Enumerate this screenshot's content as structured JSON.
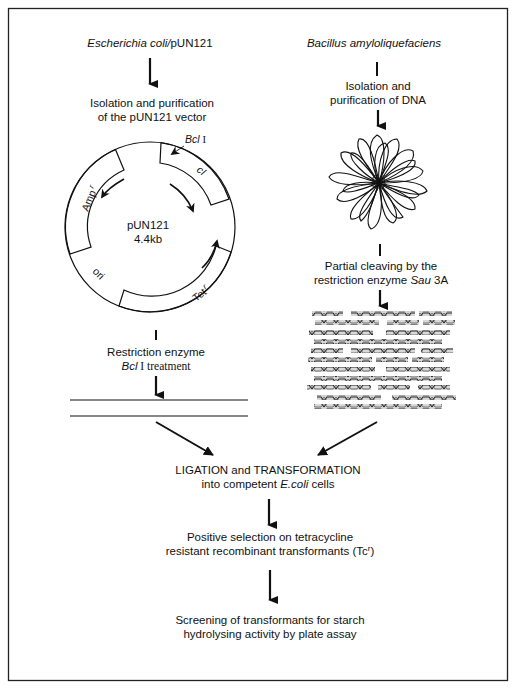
{
  "figure": {
    "type": "cloning-workflow-flowchart",
    "left_branch": {
      "source": "Escherichia coli/pUN121",
      "source_italic": "Escherichia coli/",
      "source_plain": "pUN121",
      "step1": [
        "Isolation and purification",
        "of the pUN121 vector"
      ],
      "plasmid": {
        "name": "pUN121",
        "size": "4.4kb",
        "labels": {
          "site": "Bcl",
          "site_numeral": "I",
          "gene_ci": "cI",
          "gene_amp": "Amp",
          "gene_amp_sup": "r",
          "gene_tet": "Tet",
          "gene_tet_sup": "r",
          "ori": "ori"
        }
      },
      "step2": {
        "line1": "Restriction enzyme",
        "line2_italic": "Bcl",
        "line2_rest": " I treatment"
      },
      "result": "linearized vector (two parallel lines)"
    },
    "right_branch": {
      "source": "Bacillus amyloliquefaciens",
      "step1": [
        "Isolation and",
        "purification of DNA"
      ],
      "step2": {
        "line1": "Partial cleaving by the",
        "line2_plain": "restriction enzyme ",
        "line2_italic": "Sau",
        "line2_end": " 3A"
      },
      "result": "DNA fragments"
    },
    "merge": {
      "line1": "LIGATION and TRANSFORMATION",
      "line2_plain": "into competent ",
      "line2_italic": "E.coli",
      "line2_end": " cells"
    },
    "step_selection": {
      "line1": "Positive selection on tetracycline",
      "line2": "resistant recombinant transformants (Tc",
      "line2_sup": "r",
      "line2_end": ")"
    },
    "step_screening": {
      "line1": "Screening of transformants for starch",
      "line2": "hydrolysing activity by plate assay"
    },
    "colors": {
      "ink": "#111111",
      "background": "#ffffff"
    }
  }
}
